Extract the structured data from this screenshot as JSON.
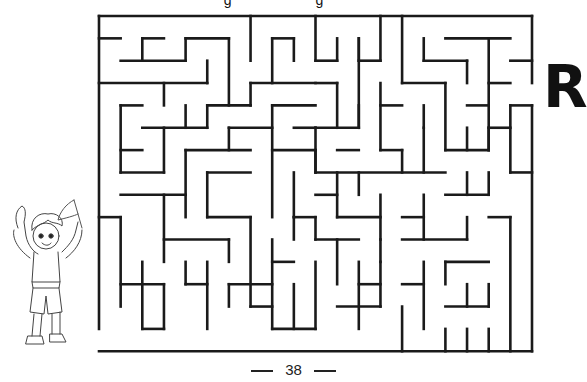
{
  "page": {
    "letter": "R",
    "page_number": "38",
    "top_cut_text": "g g"
  },
  "maze": {
    "origin": [
      99,
      16
    ],
    "cell_w": 21.65,
    "cell_h": 22.35,
    "cols": 20,
    "rows": 15,
    "stroke": "#1a1a1a",
    "stroke_width": 2.6,
    "entrance": "left wall gap between rows 14-15 (bottom-left, next to child)",
    "exit": "right wall gap between rows 3-4 (next to letter R)",
    "walls": [
      [
        0,
        0,
        20,
        0
      ],
      [
        0,
        0,
        0,
        14
      ],
      [
        0,
        15,
        20,
        15
      ],
      [
        20,
        0,
        20,
        3
      ],
      [
        20,
        4,
        20,
        15
      ],
      [
        0,
        1,
        1,
        1
      ],
      [
        2,
        1,
        3,
        1
      ],
      [
        2,
        1,
        2,
        2
      ],
      [
        1,
        2,
        4,
        2
      ],
      [
        4,
        1,
        4,
        2
      ],
      [
        4,
        1,
        6,
        1
      ],
      [
        6,
        1,
        6,
        4
      ],
      [
        5,
        2,
        5,
        3
      ],
      [
        0,
        3,
        5,
        3
      ],
      [
        7,
        0,
        7,
        2
      ],
      [
        8,
        1,
        9,
        1
      ],
      [
        8,
        1,
        8,
        3
      ],
      [
        9,
        1,
        9,
        2
      ],
      [
        7,
        3,
        10,
        3
      ],
      [
        7,
        3,
        7,
        4
      ],
      [
        5,
        4,
        7,
        4
      ],
      [
        5,
        4,
        5,
        5
      ],
      [
        3,
        3,
        3,
        4
      ],
      [
        1,
        4,
        2,
        4
      ],
      [
        1,
        4,
        1,
        7
      ],
      [
        4,
        4,
        4,
        5
      ],
      [
        2,
        5,
        5,
        5
      ],
      [
        3,
        5,
        3,
        7
      ],
      [
        1,
        7,
        3,
        7
      ],
      [
        1,
        6,
        2,
        6
      ],
      [
        6,
        5,
        8,
        5
      ],
      [
        6,
        5,
        6,
        6
      ],
      [
        4,
        6,
        7,
        6
      ],
      [
        4,
        6,
        4,
        9
      ],
      [
        5,
        7,
        7,
        7
      ],
      [
        5,
        7,
        5,
        9
      ],
      [
        8,
        4,
        8,
        9
      ],
      [
        8,
        4,
        10,
        4
      ],
      [
        9,
        5,
        10,
        5
      ],
      [
        8,
        6,
        10,
        6
      ],
      [
        9,
        7,
        9,
        9
      ],
      [
        10,
        6,
        10,
        7
      ],
      [
        10,
        0,
        10,
        2
      ],
      [
        10,
        2,
        11,
        2
      ],
      [
        11,
        1,
        11,
        2
      ],
      [
        12,
        1,
        12,
        2
      ],
      [
        12,
        2,
        13,
        2
      ],
      [
        13,
        0,
        13,
        2
      ],
      [
        14,
        0,
        14,
        3
      ],
      [
        10,
        3,
        11,
        3
      ],
      [
        11,
        3,
        11,
        5
      ],
      [
        10,
        5,
        12,
        5
      ],
      [
        12,
        1,
        12,
        5
      ],
      [
        14,
        3,
        16,
        3
      ],
      [
        13,
        3,
        13,
        6
      ],
      [
        13,
        4,
        14,
        4
      ],
      [
        13,
        6,
        14,
        6
      ],
      [
        15,
        1,
        15,
        2
      ],
      [
        15,
        2,
        17,
        2
      ],
      [
        17,
        2,
        17,
        3
      ],
      [
        16,
        1,
        19,
        1
      ],
      [
        18,
        1,
        18,
        6
      ],
      [
        19,
        2,
        20,
        2
      ],
      [
        18,
        3,
        19,
        3
      ],
      [
        16,
        3,
        16,
        6
      ],
      [
        15,
        4,
        15,
        5
      ],
      [
        17,
        4,
        18,
        4
      ],
      [
        19,
        4,
        20,
        4
      ],
      [
        19,
        4,
        19,
        7
      ],
      [
        18,
        5,
        19,
        5
      ],
      [
        18,
        5,
        18,
        6
      ],
      [
        16,
        6,
        18,
        6
      ],
      [
        17,
        5,
        17,
        6
      ],
      [
        10,
        5,
        10,
        7
      ],
      [
        11,
        7,
        11,
        9
      ],
      [
        10,
        7,
        16,
        7
      ],
      [
        15,
        5,
        15,
        7
      ],
      [
        16,
        8,
        18,
        8
      ],
      [
        18,
        7,
        18,
        8
      ],
      [
        17,
        7,
        17,
        8
      ],
      [
        12,
        4,
        12,
        5
      ],
      [
        14,
        6,
        14,
        7
      ],
      [
        9,
        9,
        10,
        9
      ],
      [
        10,
        8,
        11,
        8
      ],
      [
        11,
        9,
        13,
        9
      ],
      [
        13,
        8,
        13,
        10
      ],
      [
        0,
        9,
        1,
        9
      ],
      [
        1,
        9,
        1,
        13
      ],
      [
        1,
        8,
        4,
        8
      ],
      [
        3,
        8,
        3,
        11
      ],
      [
        3,
        10,
        6,
        10
      ],
      [
        6,
        10,
        6,
        11
      ],
      [
        5,
        9,
        7,
        9
      ],
      [
        7,
        9,
        7,
        13
      ],
      [
        5,
        11,
        5,
        14
      ],
      [
        4,
        11,
        4,
        12
      ],
      [
        4,
        12,
        5,
        12
      ],
      [
        2,
        11,
        2,
        14
      ],
      [
        2,
        14,
        3,
        14
      ],
      [
        1,
        12,
        3,
        12
      ],
      [
        3,
        12,
        3,
        14
      ],
      [
        6,
        12,
        6,
        13
      ],
      [
        6,
        12,
        8,
        12
      ],
      [
        8,
        10,
        8,
        14
      ],
      [
        8,
        11,
        9,
        11
      ],
      [
        9,
        12,
        9,
        14
      ],
      [
        7,
        13,
        8,
        13
      ],
      [
        8,
        14,
        10,
        14
      ],
      [
        10,
        11,
        10,
        14
      ],
      [
        10,
        10,
        12,
        10
      ],
      [
        11,
        10,
        11,
        12
      ],
      [
        12,
        11,
        12,
        14
      ],
      [
        11,
        13,
        13,
        13
      ],
      [
        13,
        11,
        13,
        13
      ],
      [
        9,
        9,
        9,
        10
      ],
      [
        10,
        9,
        10,
        10
      ],
      [
        15,
        8,
        15,
        10
      ],
      [
        14,
        9,
        15,
        9
      ],
      [
        14,
        10,
        17,
        10
      ],
      [
        17,
        9,
        17,
        10
      ],
      [
        18,
        9,
        19,
        9
      ],
      [
        19,
        9,
        19,
        15
      ],
      [
        13,
        10,
        13,
        11
      ],
      [
        15,
        11,
        15,
        14
      ],
      [
        16,
        11,
        18,
        11
      ],
      [
        16,
        11,
        16,
        12
      ],
      [
        14,
        12,
        15,
        12
      ],
      [
        17,
        12,
        17,
        13
      ],
      [
        16,
        13,
        18,
        13
      ],
      [
        18,
        12,
        18,
        13
      ],
      [
        18,
        14,
        18,
        15
      ],
      [
        12,
        12,
        13,
        12
      ],
      [
        14,
        13,
        14,
        15
      ],
      [
        17,
        14,
        17,
        15
      ],
      [
        16,
        14,
        16,
        15
      ],
      [
        19,
        7,
        20,
        7
      ],
      [
        11,
        6,
        12,
        6
      ],
      [
        12,
        7,
        12,
        8
      ]
    ]
  }
}
